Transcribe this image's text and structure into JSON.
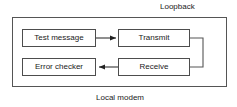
{
  "diagram": {
    "type": "block-diagram",
    "title_outside_top": "Loopback",
    "title_outside_bottom": "Local modem",
    "container": {
      "name": "local-modem-container",
      "label": "Local modem"
    },
    "blocks": [
      {
        "id": "test-message",
        "label": "Test message"
      },
      {
        "id": "transmit",
        "label": "Transmit"
      },
      {
        "id": "error-checker",
        "label": "Error checker"
      },
      {
        "id": "receive",
        "label": "Receive"
      }
    ],
    "connections": [
      {
        "from": "test-message",
        "to": "transmit",
        "arrow": "right"
      },
      {
        "from": "transmit",
        "to": "receive",
        "arrow": "loopback-right"
      },
      {
        "from": "receive",
        "to": "error-checker",
        "arrow": "left"
      }
    ],
    "colors": {
      "stroke": "#4d4d4d",
      "container_stroke": "#555555",
      "text": "#1a1a1a",
      "background": "#ffffff"
    }
  }
}
